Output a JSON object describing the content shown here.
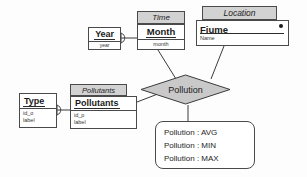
{
  "diagram": {
    "colors": {
      "tab_fill": "#d2d2d2",
      "relationship_fill": "#c9c9c9",
      "stroke": "#4a4a4a",
      "text": "#1a1a1a"
    },
    "entities": [
      {
        "id": "year",
        "title": "Year",
        "attributes": [
          "year"
        ]
      },
      {
        "id": "month",
        "tab": "Time",
        "title": "Month",
        "attributes": [
          "month"
        ]
      },
      {
        "id": "fiume",
        "tab": "Location",
        "title": "Fiume",
        "attributes": [
          "Name"
        ],
        "marker": "filled-dot"
      },
      {
        "id": "pollutants",
        "tab": "Pollutants",
        "title": "Pollutants",
        "attributes": [
          "id_p",
          "label"
        ]
      },
      {
        "id": "type",
        "title": "Type",
        "attributes": [
          "id_o",
          "label"
        ]
      }
    ],
    "relationship": {
      "id": "pollution",
      "label": "Pollution",
      "shape": "diamond"
    },
    "note": {
      "lines": [
        "Pollution : AVG",
        "Pollution : MIN",
        "Pollution : MAX"
      ]
    },
    "connections": [
      {
        "from": "year",
        "to": "month",
        "style": "crows-foot"
      },
      {
        "from": "month",
        "to": "pollution",
        "style": "line"
      },
      {
        "from": "fiume",
        "to": "pollution",
        "style": "line"
      },
      {
        "from": "type",
        "to": "pollutants",
        "style": "crows-foot"
      },
      {
        "from": "pollutants",
        "to": "pollution",
        "style": "line"
      },
      {
        "from": "pollution",
        "to": "note",
        "style": "line"
      }
    ]
  }
}
